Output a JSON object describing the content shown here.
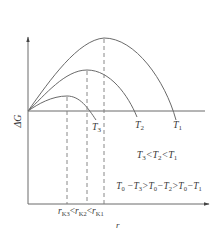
{
  "diagram": {
    "y_axis_label": "ΔG",
    "x_axis_label": "r",
    "curves": [
      {
        "id": "T1",
        "label": "T",
        "sub": "1",
        "peak": [
          104,
          38
        ],
        "end": [
          176,
          120
        ]
      },
      {
        "id": "T2",
        "label": "T",
        "sub": "2",
        "peak": [
          87,
          70
        ],
        "end": [
          137,
          117
        ]
      },
      {
        "id": "T3",
        "label": "T",
        "sub": "3",
        "peak": [
          67,
          96
        ],
        "end": [
          96,
          120
        ]
      }
    ],
    "critical_radii": {
      "labels": [
        {
          "main": "r",
          "sub": "K3"
        },
        {
          "main": "r",
          "sub": "K2"
        },
        {
          "main": "r",
          "sub": "K1"
        }
      ],
      "relation": "<"
    },
    "relation_temperatures": "T3 < T2 < T1",
    "relation_undercooling": "T0 − T3 > T0 − T2 > T0 − T1",
    "colors": {
      "line": "#6a6a6a",
      "text": "#3a3a3a",
      "background": "#ffffff"
    }
  }
}
